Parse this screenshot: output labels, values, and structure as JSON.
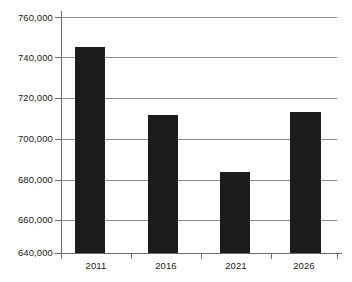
{
  "chart_data": {
    "type": "bar",
    "title": "",
    "subtitle": "",
    "xlabel": "",
    "ylabel": "",
    "categories": [
      "2011",
      "2016",
      "2021",
      "2026"
    ],
    "values": [
      745000,
      710000,
      681000,
      711500
    ],
    "series": [
      {
        "name": "",
        "values": [
          745000,
          710000,
          681000,
          711500
        ]
      }
    ],
    "ylim": [
      640000,
      760000
    ],
    "ytick_values": [
      640000,
      660000,
      680000,
      700000,
      720000,
      740000,
      760000
    ],
    "ytick_labels": [
      "640,000",
      "660,000",
      "680,000",
      "700,000",
      "720,000",
      "740,000",
      "760,000"
    ],
    "ytick_interval": 20000,
    "grid": true,
    "grid_axis": "y",
    "legend": false,
    "legend_position": "none",
    "bar_color": "#1c1c1c",
    "grid_color": "#8c8c8c",
    "axis_color": "#6b6b6b",
    "background_color": "#ffffff",
    "text_color": "#1a1a1a",
    "annotations": []
  }
}
